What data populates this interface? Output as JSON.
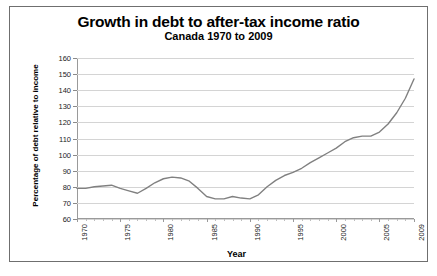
{
  "chart_data": {
    "type": "line",
    "title": "Growth in debt to after-tax income ratio",
    "subtitle": "Canada 1970 to 2009",
    "xlabel": "Year",
    "ylabel": "Percentage of debt relative to income",
    "xlim": [
      1970,
      2009
    ],
    "ylim": [
      60,
      160
    ],
    "grid": true,
    "legend": "none",
    "line_color": "#808080",
    "ytick_labels": [
      "160",
      "150",
      "140",
      "130",
      "120",
      "110",
      "100",
      "90",
      "80",
      "70",
      "60"
    ],
    "ytick_values": [
      160,
      150,
      140,
      130,
      120,
      110,
      100,
      90,
      80,
      70,
      60
    ],
    "xtick_labels": [
      "1970",
      "1975",
      "1980",
      "1985",
      "1990",
      "1995",
      "2000",
      "2005",
      "2009"
    ],
    "xtick_values": [
      1970,
      1975,
      1980,
      1985,
      1990,
      1995,
      2000,
      2005,
      2009
    ],
    "series": [
      {
        "name": "Debt to after-tax income ratio",
        "x": [
          1970,
          1971,
          1972,
          1973,
          1974,
          1975,
          1976,
          1977,
          1978,
          1979,
          1980,
          1981,
          1982,
          1983,
          1984,
          1985,
          1986,
          1987,
          1988,
          1989,
          1990,
          1991,
          1992,
          1993,
          1994,
          1995,
          1996,
          1997,
          1998,
          1999,
          2000,
          2001,
          2002,
          2003,
          2004,
          2005,
          2006,
          2007,
          2008,
          2009
        ],
        "values": [
          79,
          79,
          80,
          80.5,
          81,
          79,
          77.5,
          76,
          79,
          82.5,
          85,
          86,
          85.5,
          83.5,
          79,
          74,
          72.5,
          72.5,
          74,
          73,
          72.5,
          75,
          80,
          84,
          87,
          89,
          91.5,
          95,
          98,
          101,
          104,
          108,
          110.5,
          111.5,
          111.5,
          114,
          119,
          126,
          135,
          147
        ]
      }
    ]
  },
  "axes": {
    "y_title": "Percentage of debt relative to income",
    "x_title": "Year"
  }
}
